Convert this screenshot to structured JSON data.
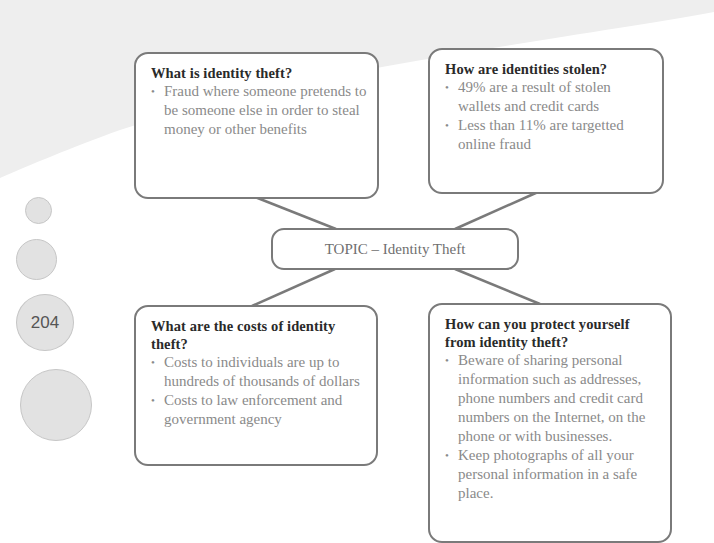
{
  "page": {
    "number": "204"
  },
  "topic": {
    "label": "TOPIC – Identity Theft"
  },
  "boxes": [
    {
      "heading": "What is identity theft?",
      "bullets": [
        "Fraud where someone pretends to be someone else in order to steal money or other benefits"
      ]
    },
    {
      "heading": "How are identities stolen?",
      "bullets": [
        "49% are a result of stolen wallets and credit cards",
        "Less than 11% are targetted online fraud"
      ]
    },
    {
      "heading": "What are the costs of identity theft?",
      "bullets": [
        "Costs to individuals are up to hundreds of thousands of dollars",
        "Costs to law enforcement and government agency"
      ]
    },
    {
      "heading": "How can you protect yourself from identity theft?",
      "bullets": [
        "Beware of sharing personal information such as addresses, phone numbers and credit card numbers on the Internet, on the phone or with businesses.",
        "Keep photographs of all your personal information in a safe place."
      ]
    }
  ],
  "bullet_glyph": "•",
  "colors": {
    "border": "#7a7a7a",
    "heading": "#2a2a2a",
    "body_text": "#8a8a8a",
    "circle_fill": "#e2e2e2",
    "background_shade": "#eeeeee"
  }
}
